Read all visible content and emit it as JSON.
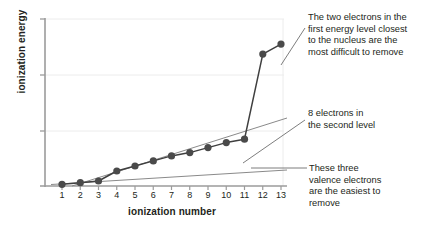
{
  "chart_data": {
    "type": "line",
    "title": "",
    "xlabel": "ionization number",
    "ylabel": "ionization energy",
    "categories": [
      1,
      2,
      3,
      4,
      5,
      6,
      7,
      8,
      9,
      10,
      11,
      12,
      13
    ],
    "xtick_labels": [
      "1",
      "2",
      "3",
      "4",
      "5",
      "6",
      "7",
      "8",
      "9",
      "10",
      "11",
      "12",
      "13"
    ],
    "ytick_labels": [],
    "xlim": [
      0.5,
      13.4
    ],
    "ylim": [
      0,
      100
    ],
    "grid": true,
    "legend": null,
    "series": [
      {
        "name": "ionization energy",
        "marker": "filled-circle",
        "color": "#4a4a4a",
        "values": [
          1,
          2,
          3,
          9,
          12,
          15,
          18,
          20,
          23,
          26,
          28,
          79,
          85
        ]
      }
    ],
    "annotations": [
      {
        "id": "first-level",
        "text": "The two electrons in the first energy level closest to the nucleus are the most difficult to remove",
        "points_to": 13
      },
      {
        "id": "second-level",
        "text": "8 electrons in the second level",
        "points_to": 11
      },
      {
        "id": "valence",
        "text": "These three valence electrons are the easiest to remove",
        "points_to": 3
      }
    ]
  },
  "annotation_lines": {
    "first_level": "The two electrons in the\nfirst energy level closest\nto the nucleus are the\nmost difficult to remove",
    "second_level": "8 electrons in\nthe second level",
    "valence": "These three\nvalence electrons\nare the easiest to\nremove"
  },
  "colors": {
    "marker": "#4a4a4a",
    "data_line": "#3f3f3f",
    "trend_line": "#8a8a8a",
    "axis": "#9b9b9b",
    "grid": "#ececec",
    "text": "#231f20",
    "leader": "#6e6e6e",
    "background": "#ffffff"
  }
}
